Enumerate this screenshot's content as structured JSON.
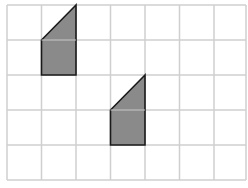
{
  "diagram": {
    "grid": {
      "columns": 7,
      "rows": 5,
      "x_lines": [
        7,
        41.5,
        76,
        110.5,
        145,
        179.5,
        214,
        246
      ],
      "y_lines": [
        5,
        40,
        75,
        110,
        145,
        180
      ],
      "line_color": "#cfcfcf"
    },
    "shapes": [
      {
        "name": "trapezoid-original",
        "fill": "#8a8a8a",
        "stroke": "#1a1a1a",
        "points": "76,5 41.5,40 41.5,75 76,75",
        "mid_line": [
          41.5,
          40,
          76,
          40
        ]
      },
      {
        "name": "trapezoid-translated",
        "fill": "#8a8a8a",
        "stroke": "#1a1a1a",
        "points": "145,75 110.5,110 110.5,145 145,145",
        "mid_line": [
          110.5,
          110,
          145,
          110
        ]
      }
    ]
  }
}
